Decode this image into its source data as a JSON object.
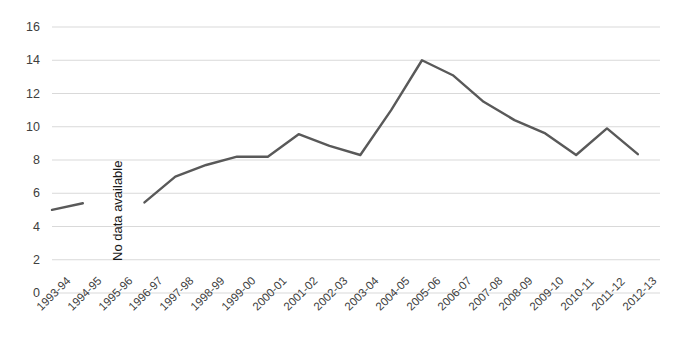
{
  "chart_data": {
    "type": "line",
    "title": "",
    "xlabel": "",
    "ylabel": "",
    "categories": [
      "1993-94",
      "1994-95",
      "1995-96",
      "1996-97",
      "1997-98",
      "1998-99",
      "1999-00",
      "2000-01",
      "2001-02",
      "2002-03",
      "2003-04",
      "2004-05",
      "2005-06",
      "2006-07",
      "2007-08",
      "2008-09",
      "2009-10",
      "2010-11",
      "2011-12",
      "2012-13"
    ],
    "values": [
      5.0,
      5.4,
      null,
      5.45,
      7.0,
      7.7,
      8.2,
      8.2,
      9.55,
      8.85,
      8.3,
      11.0,
      14.0,
      13.1,
      11.5,
      10.4,
      9.6,
      8.3,
      9.9,
      8.35
    ],
    "ylim": [
      0,
      16
    ],
    "yticks": [
      0,
      2,
      4,
      6,
      8,
      10,
      12,
      14,
      16
    ],
    "ytick_labels": [
      "0",
      "2",
      "4",
      "6",
      "8",
      "10",
      "12",
      "14",
      "16"
    ],
    "grid": true,
    "legend": "none",
    "series_color": "#595959",
    "grid_color": "#d9d9d9",
    "line_width": 2.4,
    "annotations": [
      {
        "text": "No data available",
        "category": "1995-96",
        "rotation": -90
      }
    ]
  }
}
